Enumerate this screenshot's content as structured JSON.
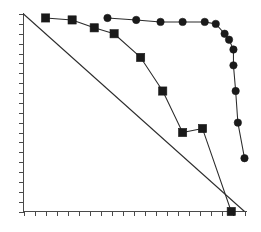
{
  "chart_data": {
    "type": "line",
    "title": "",
    "subtitle": "",
    "xlabel": "",
    "ylabel": "",
    "xlim": [
      0,
      100
    ],
    "ylim": [
      0,
      100
    ],
    "grid": false,
    "legend": "none",
    "xticks": [
      0,
      5,
      10,
      15,
      20,
      25,
      30,
      35,
      40,
      45,
      50,
      55,
      60,
      65,
      70,
      75,
      80,
      85,
      90,
      95,
      100
    ],
    "yticks": [
      0,
      5,
      10,
      15,
      20,
      25,
      30,
      35,
      40,
      45,
      50,
      55,
      60,
      65,
      70,
      75,
      80,
      85,
      90,
      95,
      100
    ],
    "xticklabels": [],
    "yticklabels": [],
    "annotations": [],
    "series": [
      {
        "name": "square-series",
        "marker": "square",
        "color": "#1a1a1a",
        "x": [
          10,
          22,
          32,
          41,
          53,
          63,
          72,
          81,
          94
        ],
        "y": [
          98,
          97,
          93,
          90,
          78,
          61,
          40,
          42,
          0
        ]
      },
      {
        "name": "circle-series",
        "marker": "circle",
        "color": "#1a1a1a",
        "x": [
          38,
          51,
          62,
          72,
          82,
          87,
          91,
          93,
          95,
          95,
          96,
          97,
          100
        ],
        "y": [
          98,
          97,
          96,
          96,
          96,
          95,
          90,
          87,
          82,
          74,
          61,
          45,
          27
        ]
      },
      {
        "name": "diagonal-reference-line",
        "marker": "none",
        "color": "#2b2b2b",
        "x": [
          0,
          100
        ],
        "y": [
          100,
          0
        ]
      }
    ]
  },
  "figure": {
    "background_color": "#ffffff",
    "axis_color": "#4a4a4a",
    "data_color": "#1a1a1a"
  }
}
